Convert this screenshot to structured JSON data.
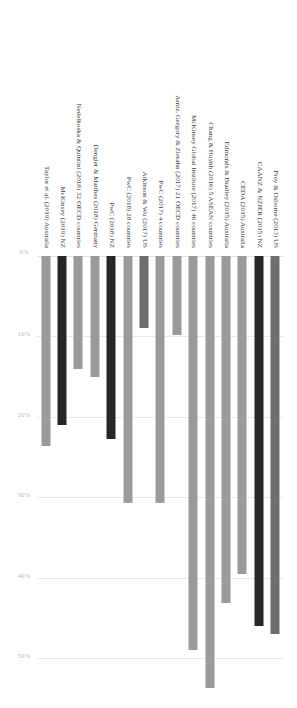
{
  "chart_data": {
    "type": "bar",
    "orientation": "vertical-rotated",
    "title": "",
    "xlabel": "",
    "ylabel": "",
    "ylim": [
      0,
      55
    ],
    "grid": true,
    "legend": null,
    "tick_labels": [
      "0%",
      "10%",
      "20%",
      "30%",
      "40%",
      "50%"
    ],
    "tick_values": [
      0,
      10,
      20,
      30,
      40,
      50
    ],
    "categories": [
      "Frey & Osborne (2013) US",
      "CAANZ & NZIER (2015) NZ",
      "CEDA (2015) Australia",
      "Edmonds & Bradley (2015) Australia",
      "Chang & Huynh (2016) 5 ASEAN countries",
      "McKinsey Global Institute (2017) 46 countries",
      "Arntz, Gregory & Zierahn (2017) 21 OECD countries",
      "PwC (2017) 4 countries",
      "Atkinson & Wu (2017) US",
      "PwC (2018) 28 countries",
      "PwC (2018) NZ",
      "Dengler & Matthes (2018) Germany",
      "Nedelkoska & Quintini (2018) 32 OECD countries",
      "McKinsey (2019) NZ",
      "Taylor et al. (2019) Australia"
    ],
    "values": [
      47.0,
      46.0,
      39.6,
      43.2,
      53.7,
      49.0,
      9.8,
      30.7,
      9.0,
      30.7,
      22.7,
      15.0,
      14.0,
      21.0,
      23.6
    ],
    "colors": [
      "#6e6e6e",
      "#262626",
      "#9a9a9a",
      "#9a9a9a",
      "#9a9a9a",
      "#9a9a9a",
      "#9a9a9a",
      "#9a9a9a",
      "#6e6e6e",
      "#9a9a9a",
      "#262626",
      "#9a9a9a",
      "#9a9a9a",
      "#262626",
      "#9a9a9a"
    ],
    "highlight_note": "New Zealand studies shown in black",
    "axis_color": "#e9e9e9",
    "tick_text_color": "#b4b4b4",
    "label_text_color": "#3a3a3a"
  }
}
